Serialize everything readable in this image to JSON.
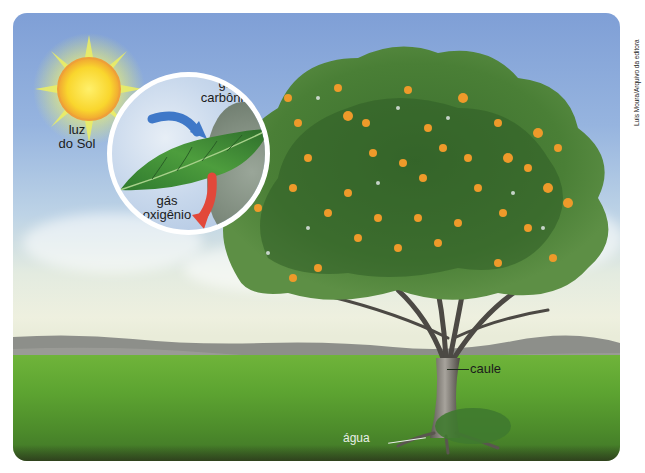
{
  "figure": {
    "type": "illustration",
    "labels": {
      "sunlight": [
        "luz",
        "do Sol"
      ],
      "carbon_dioxide": [
        "gás",
        "carbônico"
      ],
      "oxygen": [
        "gás",
        "oxigênio"
      ],
      "stem": "caule",
      "water": "água"
    },
    "credit": "Luis Moura/Arquivo da editora",
    "colors": {
      "sky": "#8fadd9",
      "grass": "#5da431",
      "leaf": "#3f8f3a",
      "co2_arrow": "#3f78c8",
      "o2_arrow": "#e2483a",
      "sun": "#f7d531",
      "fruit": "#ee9a2a"
    }
  }
}
